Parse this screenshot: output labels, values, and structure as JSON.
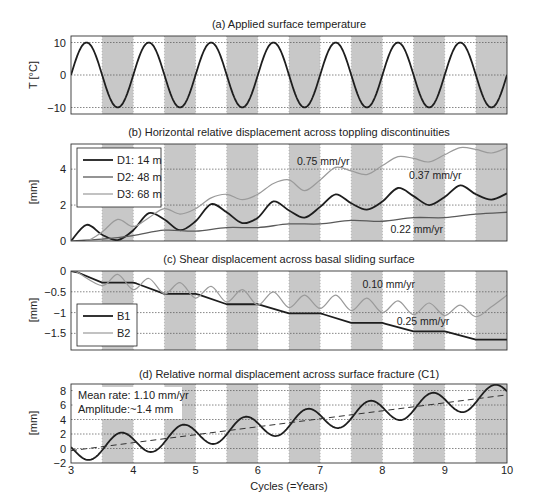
{
  "figure": {
    "xlabel": "Cycles (=Years)",
    "xticks": [
      3,
      4,
      5,
      6,
      7,
      8,
      9,
      10
    ],
    "xlim": [
      3,
      10
    ],
    "shaded_bands": [
      [
        3.5,
        4
      ],
      [
        4.5,
        5
      ],
      [
        5.5,
        6
      ],
      [
        6.5,
        7
      ],
      [
        7.5,
        8
      ],
      [
        8.5,
        9
      ],
      [
        9.5,
        10
      ]
    ],
    "colors": {
      "band": "#c8c8c8",
      "dark": "#1e1e1e",
      "mid": "#5a5a5a",
      "light": "#9a9a9a",
      "grid": "#555555"
    }
  },
  "chart_data": [
    {
      "id": "a",
      "type": "line",
      "title": "(a) Applied surface temperature",
      "xlabel": "",
      "ylabel": "T [°C]",
      "ylim": [
        -12,
        12
      ],
      "yticks": [
        -10,
        0,
        10
      ],
      "ytick_labels": [
        "−10",
        "0",
        "10"
      ],
      "grid": true,
      "legend": null,
      "series": [
        {
          "name": "Temperature",
          "style": "dark",
          "function": "10*sin(2*pi*(x-3))",
          "amplitude": 10,
          "period": 1
        }
      ],
      "annotations": []
    },
    {
      "id": "b",
      "type": "line",
      "title": "(b) Horizontal relative displacement across toppling discontinuities",
      "xlabel": "",
      "ylabel": "[mm]",
      "ylim": [
        0,
        5.4
      ],
      "yticks": [
        0,
        2,
        4
      ],
      "ytick_labels": [
        "0",
        "2",
        "4"
      ],
      "grid": true,
      "legend": {
        "position": "upper left",
        "entries": [
          "D1: 14 m",
          "D2: 48 m",
          "D3: 68 m"
        ]
      },
      "series": [
        {
          "name": "D1: 14 m",
          "style": "dark",
          "x": [
            3.0,
            3.25,
            3.5,
            3.75,
            4.0,
            4.25,
            4.5,
            4.75,
            5.0,
            5.25,
            5.5,
            5.75,
            6.0,
            6.25,
            6.5,
            6.75,
            7.0,
            7.25,
            7.5,
            7.75,
            8.0,
            8.25,
            8.5,
            8.75,
            9.0,
            9.25,
            9.5,
            9.75,
            10.0
          ],
          "y": [
            0.0,
            0.9,
            0.35,
            0.05,
            0.6,
            1.55,
            1.2,
            0.6,
            1.1,
            2.05,
            1.6,
            1.0,
            1.3,
            2.2,
            1.7,
            1.3,
            1.9,
            2.6,
            2.1,
            1.75,
            2.2,
            2.95,
            2.5,
            2.0,
            2.45,
            3.1,
            2.6,
            2.3,
            2.65
          ]
        },
        {
          "name": "D2: 48 m",
          "style": "mid",
          "x": [
            3.0,
            3.5,
            4.0,
            4.5,
            5.0,
            5.5,
            6.0,
            6.5,
            7.0,
            7.5,
            8.0,
            8.5,
            9.0,
            9.5,
            10.0
          ],
          "y": [
            0.0,
            0.1,
            0.3,
            0.6,
            0.55,
            0.75,
            0.75,
            0.95,
            0.95,
            1.15,
            1.1,
            1.3,
            1.3,
            1.5,
            1.6
          ]
        },
        {
          "name": "D3: 68 m",
          "style": "light",
          "x": [
            3.0,
            3.25,
            3.5,
            3.75,
            4.0,
            4.25,
            4.5,
            4.75,
            5.0,
            5.25,
            5.5,
            5.75,
            6.0,
            6.25,
            6.5,
            6.75,
            7.0,
            7.25,
            7.5,
            7.75,
            8.0,
            8.25,
            8.5,
            8.75,
            9.0,
            9.25,
            9.5,
            9.75,
            10.0
          ],
          "y": [
            0.0,
            0.0,
            0.5,
            1.2,
            0.8,
            1.3,
            1.8,
            1.5,
            1.8,
            2.4,
            2.6,
            2.3,
            2.6,
            3.2,
            3.4,
            2.8,
            3.4,
            4.1,
            3.9,
            3.7,
            4.2,
            4.7,
            4.6,
            4.4,
            4.8,
            5.2,
            5.1,
            4.9,
            5.2
          ]
        }
      ],
      "annotations": [
        {
          "text": "0.75 mm/yr",
          "x": 7.05,
          "y": 4.25
        },
        {
          "text": "0.37 mm/yr",
          "x": 8.85,
          "y": 3.45
        },
        {
          "text": "0.22 mm/yr",
          "x": 8.55,
          "y": 0.45
        }
      ]
    },
    {
      "id": "c",
      "type": "line",
      "title": "(c) Shear displacement across basal sliding surface",
      "xlabel": "",
      "ylabel": "[mm]",
      "ylim": [
        -1.9,
        0
      ],
      "yticks": [
        -1.5,
        -1,
        -0.5,
        0
      ],
      "ytick_labels": [
        "−1.5",
        "−1",
        "−0.5",
        "0"
      ],
      "grid": true,
      "legend": {
        "position": "lower left",
        "entries": [
          "B1",
          "B2"
        ]
      },
      "series": [
        {
          "name": "B1",
          "style": "dark",
          "x": [
            3.0,
            3.1,
            3.5,
            4.0,
            4.05,
            4.5,
            5.0,
            5.05,
            5.5,
            6.0,
            6.05,
            6.5,
            7.0,
            7.05,
            7.5,
            8.0,
            8.05,
            8.5,
            9.0,
            9.05,
            9.5,
            10.0
          ],
          "y": [
            0.0,
            -0.03,
            -0.28,
            -0.28,
            -0.3,
            -0.55,
            -0.55,
            -0.57,
            -0.8,
            -0.8,
            -0.82,
            -1.02,
            -1.02,
            -1.04,
            -1.25,
            -1.25,
            -1.27,
            -1.45,
            -1.45,
            -1.47,
            -1.65,
            -1.65
          ]
        },
        {
          "name": "B2",
          "style": "light",
          "x": [
            3.0,
            3.1,
            3.5,
            3.75,
            4.0,
            4.25,
            4.5,
            4.75,
            5.0,
            5.25,
            5.5,
            5.75,
            6.0,
            6.25,
            6.5,
            6.75,
            7.0,
            7.25,
            7.5,
            7.75,
            8.0,
            8.25,
            8.5,
            8.75,
            9.0,
            9.25,
            9.5,
            9.75,
            10.0
          ],
          "y": [
            0.0,
            -0.03,
            -0.35,
            -0.08,
            -0.45,
            -0.18,
            -0.55,
            -0.28,
            -0.65,
            -0.37,
            -0.75,
            -0.45,
            -0.82,
            -0.5,
            -0.88,
            -0.58,
            -0.9,
            -0.58,
            -0.95,
            -0.65,
            -1.0,
            -0.72,
            -1.05,
            -0.77,
            -1.07,
            -0.82,
            -1.1,
            -0.86,
            -0.58
          ]
        }
      ],
      "annotations": [
        {
          "text": "0.10 mm/yr",
          "x": 8.1,
          "y": -0.4
        },
        {
          "text": "0.25 mm/yr",
          "x": 8.65,
          "y": -1.3
        }
      ]
    },
    {
      "id": "d",
      "type": "line",
      "title": "(d) Relative normal displacement across surface fracture (C1)",
      "xlabel": "Cycles (=Years)",
      "ylabel": "[mm]",
      "ylim": [
        -2,
        8.9
      ],
      "yticks": [
        -2,
        0,
        2,
        4,
        6,
        8
      ],
      "ytick_labels": [
        "−2",
        "0",
        "2",
        "4",
        "6",
        "8"
      ],
      "grid": true,
      "legend": null,
      "series": [
        {
          "name": "C1",
          "style": "dark",
          "function": "-0.3+1.1*(x-3)+1.6*sin(2*pi*(x-3.55))"
        },
        {
          "name": "Mean trend",
          "style": "dashed",
          "x": [
            3,
            10
          ],
          "y": [
            -0.3,
            7.4
          ]
        }
      ],
      "annotations": [
        {
          "text": "Mean rate: 1.10 mm/yr",
          "box": true
        },
        {
          "text": "Amplitude:~1.4 mm",
          "box": true
        }
      ]
    }
  ]
}
